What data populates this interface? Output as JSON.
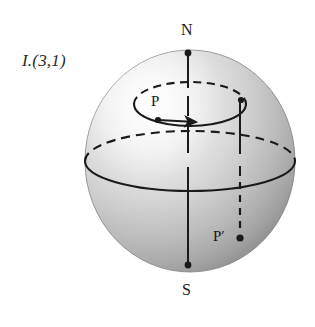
{
  "figure": {
    "title_label": "I.(3,1)",
    "background_color": "#ffffff",
    "ink_color": "#1a1a1a",
    "sphere": {
      "center_x": 190,
      "center_y": 161,
      "radius_x": 105,
      "radius_y": 111,
      "fill_light": "#f2f2f2",
      "fill_mid": "#c9c9c9",
      "fill_dark": "#8f8f8f",
      "highlight_x": 120,
      "highlight_y": 85
    },
    "labels": [
      {
        "name": "north-pole",
        "text": "N"
      },
      {
        "name": "south-pole",
        "text": "S"
      },
      {
        "name": "point-p",
        "text": "P"
      },
      {
        "name": "point-p-prime",
        "text": "P′"
      }
    ],
    "annotations": {
      "north_pole": "N",
      "south_pole": "S",
      "point_p": "P",
      "point_p_prime": "P′"
    },
    "markers": [
      {
        "name": "north-pole-dot",
        "x": 188,
        "y": 53
      },
      {
        "name": "south-pole-dot",
        "x": 188,
        "y": 265
      },
      {
        "name": "point-p-dot",
        "x": 158,
        "y": 120
      },
      {
        "name": "point-p-prime-dot",
        "x": 240,
        "y": 238
      }
    ],
    "curves": {
      "polar_axis": {
        "style": "solid",
        "from_y": 53,
        "to_y": 265,
        "x": 188
      },
      "equator_front": {
        "style": "solid"
      },
      "equator_back": {
        "style": "dashed"
      },
      "latitude_circle_front": {
        "style": "solid"
      },
      "latitude_circle_back": {
        "style": "dashed"
      },
      "drop_line_upper": {
        "style": "solid",
        "from_y": 100,
        "to_y": 176,
        "x": 240
      },
      "drop_line_lower": {
        "style": "dashed",
        "from_y": 176,
        "to_y": 236,
        "x": 240
      },
      "direction_arrow": {
        "name": "latitude-direction-arrow",
        "points": "east"
      }
    }
  }
}
